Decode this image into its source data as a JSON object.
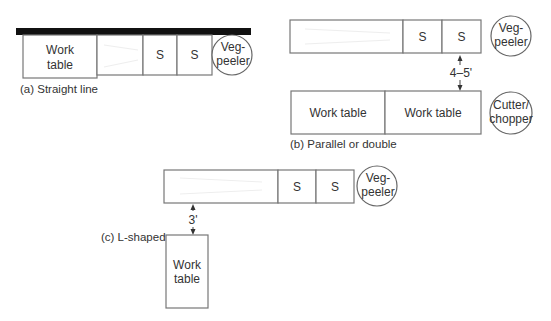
{
  "figure": {
    "panels": [
      {
        "id": "a",
        "caption": "(a) Straight line",
        "wall": true,
        "units": [
          {
            "type": "rect",
            "label_lines": [
              "Work",
              "table"
            ]
          },
          {
            "type": "rect",
            "label_lines": []
          },
          {
            "type": "rect",
            "label_lines": [
              "S"
            ]
          },
          {
            "type": "rect",
            "label_lines": [
              "S"
            ]
          },
          {
            "type": "circle",
            "label_lines": [
              "Veg-",
              "peeler"
            ]
          }
        ]
      },
      {
        "id": "b",
        "caption": "(b) Parallel or double",
        "top_row": [
          {
            "type": "rect",
            "label_lines": []
          },
          {
            "type": "rect",
            "label_lines": [
              "S"
            ]
          },
          {
            "type": "rect",
            "label_lines": [
              "S"
            ]
          },
          {
            "type": "circle",
            "label_lines": [
              "Veg-",
              "peeler"
            ]
          }
        ],
        "dimension": "4–5'",
        "bottom_row": [
          {
            "type": "rect",
            "label_lines": [
              "Work table"
            ]
          },
          {
            "type": "rect",
            "label_lines": [
              "Work table"
            ]
          },
          {
            "type": "circle",
            "label_lines": [
              "Cutter/",
              "chopper"
            ]
          }
        ]
      },
      {
        "id": "c",
        "caption": "(c) L-shaped",
        "top_row": [
          {
            "type": "rect",
            "label_lines": []
          },
          {
            "type": "rect",
            "label_lines": [
              "S"
            ]
          },
          {
            "type": "rect",
            "label_lines": [
              "S"
            ]
          },
          {
            "type": "circle",
            "label_lines": [
              "Veg-",
              "peeler"
            ]
          }
        ],
        "dimension": "3'",
        "leg": {
          "type": "rect",
          "label_lines": [
            "Work",
            "table"
          ]
        }
      }
    ]
  }
}
